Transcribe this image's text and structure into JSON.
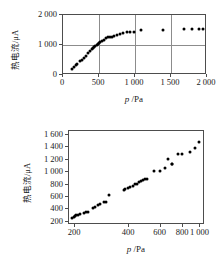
{
  "figure": {
    "background": "#ffffff",
    "point_color": "#000000",
    "axis_color": "#4d4d4d",
    "grid_color": "#8c8c8c"
  },
  "chart_data": [
    {
      "type": "scatter",
      "panel": "top",
      "title": "",
      "xlabel_italic": "p",
      "xlabel_unit": "/Pa",
      "ylabel": "热电流/μA",
      "ylabel_cn": "热电流",
      "ylabel_unit": "/μA",
      "xlim": [
        0,
        2000
      ],
      "ylim": [
        0,
        2000
      ],
      "xticks": [
        0,
        500,
        1000,
        1500,
        2000
      ],
      "xticklabels": [
        "0",
        "500",
        "1 000",
        "1 500",
        "2 000"
      ],
      "yticks": [
        0,
        1000,
        2000
      ],
      "yticklabels": [
        "0",
        "1 000",
        "2 000"
      ],
      "grid": true,
      "gridlines_x": [
        500,
        1000,
        1500
      ],
      "gridlines_y": [
        1000
      ],
      "legend": null,
      "x": [
        140,
        165,
        190,
        215,
        245,
        275,
        300,
        330,
        360,
        390,
        410,
        430,
        450,
        465,
        480,
        495,
        510,
        530,
        555,
        580,
        610,
        640,
        665,
        690,
        720,
        760,
        800,
        850,
        900,
        950,
        1000,
        1100,
        1400,
        1700,
        1800,
        1900,
        1960
      ],
      "y": [
        170,
        230,
        300,
        330,
        420,
        480,
        545,
        610,
        690,
        760,
        820,
        860,
        905,
        950,
        980,
        1000,
        1040,
        1060,
        1090,
        1120,
        1190,
        1230,
        1250,
        1250,
        1270,
        1310,
        1340,
        1360,
        1390,
        1400,
        1415,
        1475,
        1470,
        1490,
        1500,
        1505,
        1500
      ]
    },
    {
      "type": "scatter",
      "panel": "bottom",
      "title": "",
      "xlabel_italic": "p",
      "xlabel_unit": "/Pa",
      "ylabel": "热电流/μA",
      "ylabel_cn": "热电流",
      "ylabel_unit": "/μA",
      "xscale": "log",
      "xlim": [
        185,
        1060
      ],
      "ylim": [
        150,
        1660
      ],
      "xticks": [
        200,
        400,
        600,
        800,
        1000
      ],
      "xticklabels": [
        "200",
        "400",
        "600",
        "800",
        "1 000"
      ],
      "yticks": [
        200,
        400,
        600,
        800,
        1000,
        1200,
        1400,
        1600
      ],
      "yticklabels": [
        "200",
        "400",
        "600",
        "800",
        "1 000",
        "1 200",
        "1 400",
        "1 600"
      ],
      "grid": false,
      "legend": null,
      "x": [
        196,
        199,
        202,
        205,
        210,
        216,
        228,
        232,
        240,
        255,
        262,
        272,
        280,
        292,
        300,
        312,
        378,
        386,
        398,
        412,
        424,
        438,
        450,
        462,
        474,
        486,
        498,
        512,
        560,
        600,
        640,
        672,
        700,
        706,
        760,
        800,
        880,
        940,
        1000
      ],
      "y": [
        248,
        262,
        276,
        290,
        300,
        310,
        330,
        338,
        344,
        400,
        420,
        450,
        470,
        498,
        505,
        620,
        700,
        712,
        730,
        750,
        768,
        790,
        800,
        820,
        840,
        862,
        880,
        880,
        1000,
        1000,
        1050,
        1200,
        1120,
        1118,
        1280,
        1280,
        1300,
        1370,
        1460
      ]
    }
  ]
}
